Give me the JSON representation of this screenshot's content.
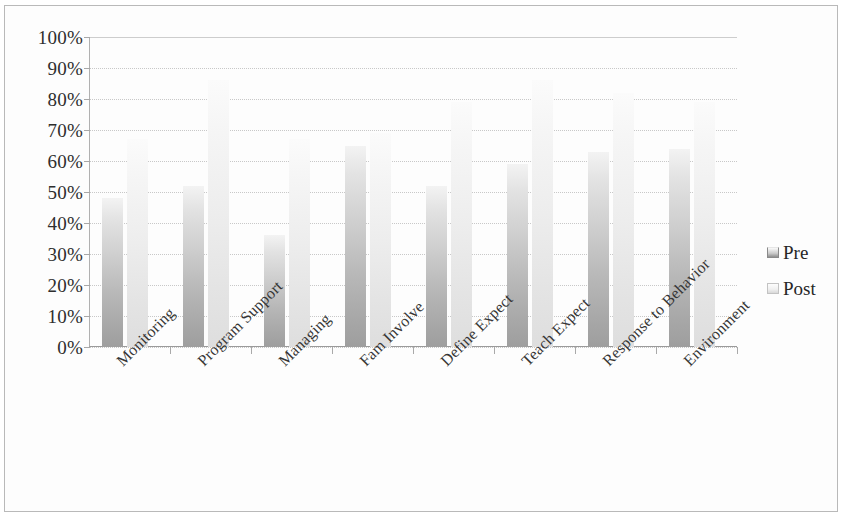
{
  "chart_data": {
    "type": "bar",
    "title": "",
    "subtitle": "",
    "xlabel": "",
    "ylabel": "",
    "categories": [
      "Monitoring",
      "Program Support",
      "Managing",
      "Fam Involve",
      "Define Expect",
      "Teach Expect",
      "Response to Behavior",
      "Environment"
    ],
    "series": [
      {
        "name": "Pre",
        "values": [
          48,
          52,
          36,
          65,
          52,
          59,
          63,
          64
        ]
      },
      {
        "name": "Post",
        "values": [
          67,
          86,
          67,
          69,
          79,
          86,
          82,
          79
        ]
      }
    ],
    "ylim": [
      0,
      100
    ],
    "ytick_labels": [
      "100%",
      "90%",
      "80%",
      "70%",
      "60%",
      "50%",
      "40%",
      "30%",
      "20%",
      "10%",
      "0%"
    ],
    "ytick_values": [
      100,
      90,
      80,
      70,
      60,
      50,
      40,
      30,
      20,
      10,
      0
    ],
    "grid": true,
    "legend_position": "right",
    "legend": [
      {
        "label": "Pre",
        "color": "#b8b8b8"
      },
      {
        "label": "Post",
        "color": "#ededed"
      }
    ],
    "value_unit": "%"
  }
}
